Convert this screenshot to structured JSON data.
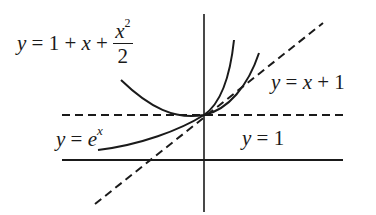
{
  "diagram": {
    "type": "function-approximation-graph",
    "colors": {
      "ink": "#1a1a1a",
      "background": "#ffffff"
    },
    "labels": {
      "quadratic": {
        "lhs": "y",
        "eq": "=",
        "terms": "1 + ",
        "var": "x",
        "plus": " + ",
        "frac_num_var": "x",
        "frac_num_exp": "2",
        "frac_den": "2"
      },
      "linear": {
        "lhs": "y",
        "rest": " = ",
        "var": "x",
        "tail": " + 1"
      },
      "exponential": {
        "lhs": "y",
        "rest": " = ",
        "base": "e",
        "exp": "x"
      },
      "constant": {
        "lhs": "y",
        "rest": " = 1"
      }
    },
    "curves": [
      {
        "name": "y = e^x",
        "style": "solid"
      },
      {
        "name": "y = 1 + x + x^2/2",
        "style": "solid"
      },
      {
        "name": "y = x + 1",
        "style": "dashed"
      },
      {
        "name": "y = 1",
        "style": "dashed"
      }
    ],
    "axes": {
      "x_axis": "solid horizontal line",
      "y_axis": "solid vertical line"
    },
    "tangent_point": {
      "x": 0,
      "y": 1
    }
  }
}
